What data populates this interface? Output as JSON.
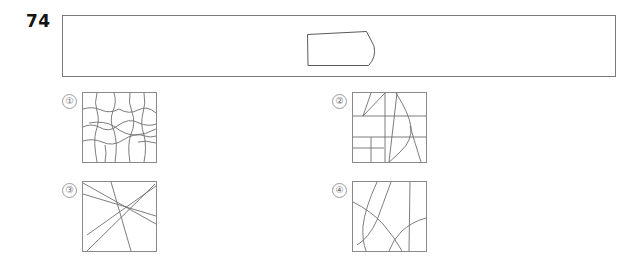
{
  "question": {
    "number": "74",
    "type": "visual-pattern-multiple-choice"
  },
  "prompt": {
    "name": "prompt-banner",
    "figure": {
      "name": "trapezoid-with-curved-right-edge",
      "description": "quadrilateral: flat top edge sloping slightly up to the right, vertical left edge, flat bottom edge, concave curved right edge",
      "stroke_color": "#5a5a5a",
      "fill_color": "#ffffff"
    },
    "border_color": "#7a7a7a",
    "background_color": "#ffffff"
  },
  "options": [
    {
      "label": "①",
      "number": "1",
      "name": "option-1",
      "pattern": "irregular-wavy-grid",
      "description": "network of wavy, hand-drawn quadrilateral cells forming an irregular grid"
    },
    {
      "label": "②",
      "number": "2",
      "name": "option-2",
      "pattern": "horizontal-bands-with-diagonals-and-curve",
      "description": "three horizontal band lines crossed by vertical and diagonal straight lines plus an S-shaped curve"
    },
    {
      "label": "③",
      "number": "3",
      "name": "option-3",
      "pattern": "crossing-straight-diagonals",
      "description": "five straight lines crossing near a common point in the upper middle of the square"
    },
    {
      "label": "④",
      "number": "4",
      "name": "option-4",
      "pattern": "smooth-arcs",
      "description": "several smooth curved arcs sweeping across the square with one near-vertical line at right"
    }
  ],
  "colors": {
    "ink": "#141414",
    "line": "#6e6e6e",
    "border": "#7a7a7a",
    "label": "#6a6a6a",
    "background": "#ffffff"
  }
}
